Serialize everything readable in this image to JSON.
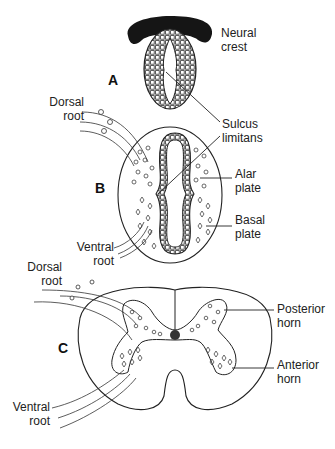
{
  "figure": {
    "panels": [
      {
        "id": "A",
        "label": "A",
        "stage": "neural tube (early)"
      },
      {
        "id": "B",
        "label": "B",
        "stage": "neural tube (intermediate)"
      },
      {
        "id": "C",
        "label": "C",
        "stage": "spinal cord cross-section"
      }
    ],
    "labels": {
      "neural_crest_1": "Neural",
      "neural_crest_2": "crest",
      "sulcus_1": "Sulcus",
      "sulcus_2": "limitans",
      "dorsal_root_b_1": "Dorsal",
      "dorsal_root_b_2": "root",
      "alar_1": "Alar",
      "alar_2": "plate",
      "basal_1": "Basal",
      "basal_2": "plate",
      "ventral_root_b_1": "Ventral",
      "ventral_root_b_2": "root",
      "dorsal_root_c_1": "Dorsal",
      "dorsal_root_c_2": "root",
      "posterior_1": "Posterior",
      "posterior_2": "horn",
      "anterior_1": "Anterior",
      "anterior_2": "horn",
      "ventral_root_c_1": "Ventral",
      "ventral_root_c_2": "root"
    },
    "colors": {
      "ink": "#222222",
      "neural_crest_fill": "#151515",
      "background": "#ffffff"
    }
  }
}
